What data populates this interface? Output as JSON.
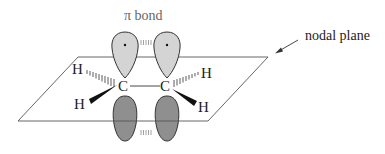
{
  "diagram": {
    "labels": {
      "pi_bond": "π bond",
      "nodal_plane": "nodal plane"
    },
    "atoms": {
      "carbon_left": "C",
      "carbon_right": "C",
      "h_upper_left": "H",
      "h_lower_left": "H",
      "h_upper_right": "H",
      "h_lower_right": "H"
    },
    "colors": {
      "upper_lobe_fill": "#d4d4d4",
      "lower_lobe_fill": "#8f8f8f",
      "stroke": "#333333",
      "plane_stroke": "#555555",
      "pi_label": "#666666"
    }
  }
}
